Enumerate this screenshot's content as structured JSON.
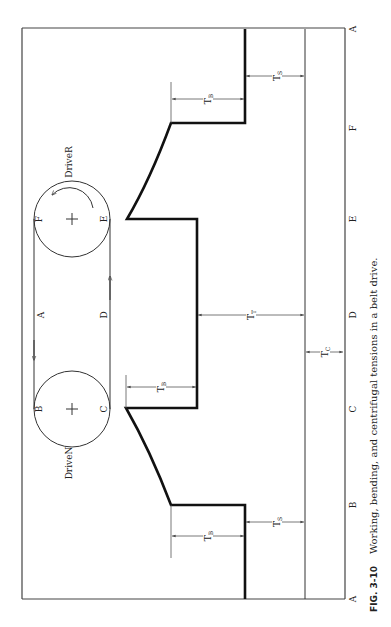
{
  "figure": {
    "number": "FIG. 3-10",
    "caption": "Working, bending, and centrifugal tensions in a belt drive."
  },
  "pulleys": {
    "driver": {
      "label": "DriveR",
      "points": [
        "F",
        "E"
      ]
    },
    "driven": {
      "label": "DriveN",
      "points": [
        "B",
        "C"
      ]
    }
  },
  "belt_labels": {
    "slack_side": "A",
    "tight_side": "D"
  },
  "axis_labels": [
    "A",
    "F",
    "E",
    "D",
    "C",
    "B",
    "A"
  ],
  "dimensions": {
    "tb_top": "T",
    "tb_top_sub": "B",
    "ts_top": "T",
    "ts_top_sub": "S",
    "tb_mid_top": "T",
    "tb_mid_top_sub": "B",
    "tt": "T",
    "tt_sub": "T",
    "tc": "T",
    "tc_sub": "C",
    "tb_bottom": "T",
    "tb_bottom_sub": "B",
    "ts_bottom": "T",
    "ts_bottom_sub": "S"
  }
}
